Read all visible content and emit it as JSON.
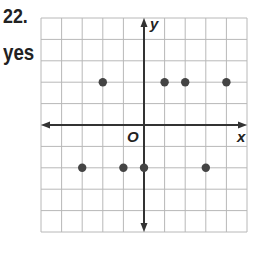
{
  "problem": {
    "number": "22.",
    "answer": "yes"
  },
  "colors": {
    "grid": "#b8b8b8",
    "axis": "#333333",
    "point": "#444444",
    "text": "#222222"
  },
  "chart_data": {
    "type": "scatter",
    "title": "",
    "xlabel": "x",
    "ylabel": "y",
    "origin_label": "O",
    "xlim": [
      -5,
      5
    ],
    "ylim": [
      -5,
      5
    ],
    "grid": true,
    "points": [
      {
        "x": -2,
        "y": 2
      },
      {
        "x": 1,
        "y": 2
      },
      {
        "x": 2,
        "y": 2
      },
      {
        "x": 4,
        "y": 2
      },
      {
        "x": -3,
        "y": -2
      },
      {
        "x": -1,
        "y": -2
      },
      {
        "x": 0,
        "y": -2
      },
      {
        "x": 3,
        "y": -2
      }
    ]
  }
}
